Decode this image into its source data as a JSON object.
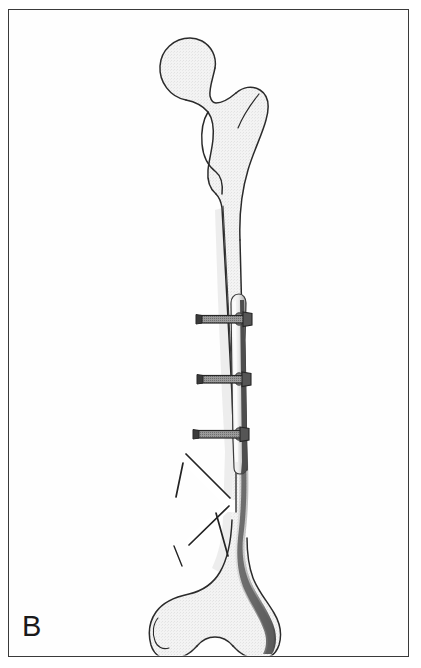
{
  "figure": {
    "panel_label": "B",
    "description": "Line drawing of a left femur, anterior view, showing a comminuted oblique mid-distal shaft fracture stabilized by a lateral bone plate secured with three transverse cortical screws.",
    "view": "anterior",
    "bone": "femur"
  },
  "canvas": {
    "width": 421,
    "height": 668,
    "background_color": "#ffffff",
    "border_color": "#3a3a3a",
    "border_inset_px": 8
  },
  "palette": {
    "outline": "#2b2b2b",
    "bone_fill": "#f1f1f1",
    "bone_fill_shadow": "#e4e4e4",
    "cortex_shadow": "#6e6e6e",
    "cortex_shadow_dark": "#4a4a4a",
    "plate_fill": "#ededed",
    "plate_edge_dark": "#5a5a5a",
    "screw_body": "#8a8a8a",
    "screw_outline": "#2e2e2e",
    "fracture_gap": "#ffffff",
    "label_color": "#1a1a1a"
  },
  "anatomy": {
    "parts": [
      {
        "name": "femoral-head",
        "label": "Femoral head",
        "center_x": 190,
        "center_y": 70,
        "radius": 32
      },
      {
        "name": "femoral-neck",
        "label": "Femoral neck",
        "x": 205,
        "y": 95
      },
      {
        "name": "greater-trochanter",
        "label": "Greater trochanter",
        "x": 252,
        "y": 95
      },
      {
        "name": "lesser-trochanter",
        "label": "Lesser trochanter",
        "x": 208,
        "y": 152
      },
      {
        "name": "femoral-shaft",
        "label": "Femoral shaft (diaphysis)",
        "x": 225,
        "y": 330
      },
      {
        "name": "medial-condyle",
        "label": "Medial condyle",
        "x": 175,
        "y": 615
      },
      {
        "name": "lateral-condyle",
        "label": "Lateral condyle",
        "x": 245,
        "y": 605
      },
      {
        "name": "intercondylar-notch",
        "label": "Intercondylar notch",
        "x": 212,
        "y": 648
      }
    ]
  },
  "implant": {
    "plate": {
      "name": "compression-plate",
      "label": "Lateral compression plate",
      "top_y": 294,
      "bottom_y": 470,
      "left_x": 231,
      "right_x": 247,
      "length_px": 176,
      "side": "lateral"
    },
    "screws": [
      {
        "name": "screw-proximal",
        "label": "Cortical screw 1",
        "y": 319,
        "head_x": 196,
        "tip_x": 252
      },
      {
        "name": "screw-middle",
        "label": "Cortical screw 2",
        "y": 379,
        "head_x": 197,
        "tip_x": 250
      },
      {
        "name": "screw-distal",
        "label": "Cortical screw 3",
        "y": 434,
        "head_x": 193,
        "tip_x": 248
      }
    ],
    "screw_count": 3
  },
  "fracture": {
    "name": "comminuted-oblique-fracture",
    "label": "Comminuted oblique shaft fracture",
    "region_top_y": 452,
    "region_bottom_y": 560,
    "fragment_count": 3,
    "lines": [
      {
        "name": "fracture-line-proximal-oblique"
      },
      {
        "name": "fracture-line-butterfly-upper"
      },
      {
        "name": "fracture-line-butterfly-lower"
      },
      {
        "name": "fracture-line-distal-oblique"
      }
    ]
  }
}
